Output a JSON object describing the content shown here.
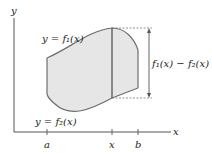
{
  "diagram": {
    "axes": {
      "x_label": "x",
      "y_label": "y"
    },
    "curves": {
      "upper": {
        "label": "y = f₁(x)"
      },
      "lower": {
        "label": "y = f₂(x)"
      }
    },
    "difference_label": "f₁(x) − f₂(x)",
    "ticks": [
      {
        "label": "a"
      },
      {
        "label": "x"
      },
      {
        "label": "b"
      }
    ],
    "colors": {
      "region_fill": "#e6e6e6",
      "curve_stroke": "#6e6e6e",
      "axis_stroke": "#555555",
      "text": "#222222"
    }
  }
}
